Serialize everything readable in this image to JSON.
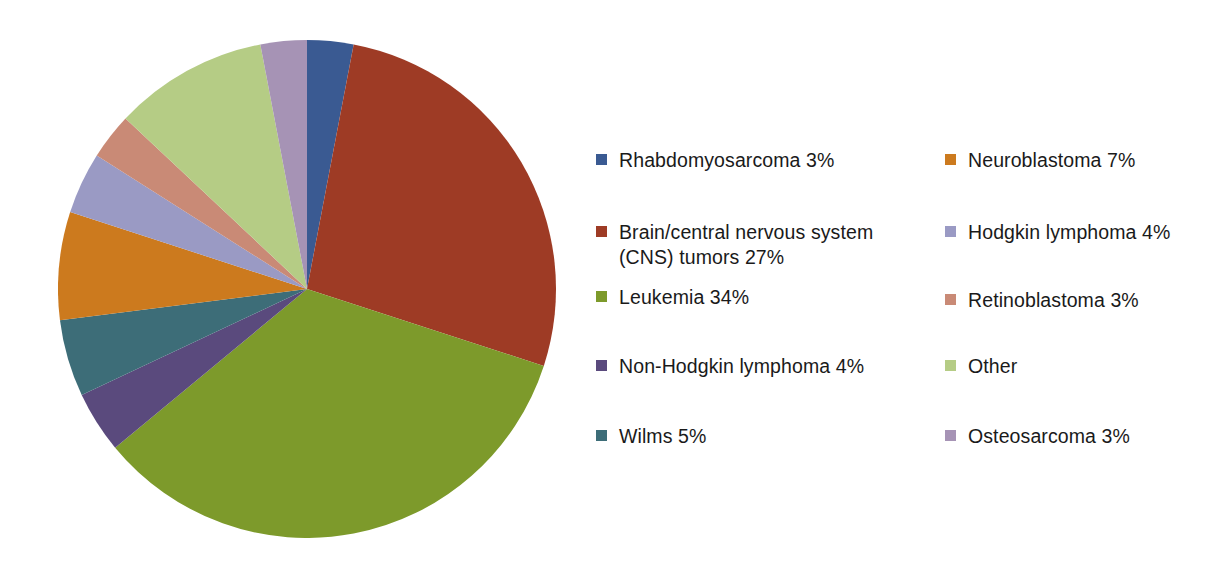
{
  "chart_data": {
    "type": "pie",
    "title": "",
    "subtitle": "",
    "xlabel": "",
    "ylabel": "",
    "grid": false,
    "legend_position": "right",
    "legend_columns": 2,
    "start_angle_deg": 0,
    "direction": "clockwise",
    "units": "percent",
    "total": 100,
    "categories": [
      "Rhabdomyosarcoma",
      "Brain/central nervous system (CNS) tumors",
      "Leukemia",
      "Non-Hodgkin lymphoma",
      "Wilms",
      "Neuroblastoma",
      "Hodgkin lymphoma",
      "Retinoblastoma",
      "Other",
      "Osteosarcoma"
    ],
    "values": [
      3,
      27,
      34,
      4,
      5,
      7,
      4,
      3,
      10,
      3
    ],
    "colors": [
      "#3a5a92",
      "#9e3b25",
      "#7d9a2b",
      "#5a4a7d",
      "#3d6d78",
      "#cc7a1e",
      "#9a9ac4",
      "#c98a76",
      "#b5cc85",
      "#a693b5"
    ],
    "slices": [
      {
        "label": "Rhabdomyosarcoma",
        "value": 3,
        "color": "#3a5a92"
      },
      {
        "label": "Brain/central nervous system (CNS) tumors",
        "value": 27,
        "color": "#9e3b25"
      },
      {
        "label": "Leukemia",
        "value": 34,
        "color": "#7d9a2b"
      },
      {
        "label": "Non-Hodgkin lymphoma",
        "value": 4,
        "color": "#5a4a7d"
      },
      {
        "label": "Wilms",
        "value": 5,
        "color": "#3d6d78"
      },
      {
        "label": "Neuroblastoma",
        "value": 7,
        "color": "#cc7a1e"
      },
      {
        "label": "Hodgkin lymphoma",
        "value": 4,
        "color": "#9a9ac4"
      },
      {
        "label": "Retinoblastoma",
        "value": 3,
        "color": "#c98a76"
      },
      {
        "label": "Other",
        "value": 10,
        "color": "#b5cc85"
      },
      {
        "label": "Osteosarcoma",
        "value": 3,
        "color": "#a693b5"
      }
    ]
  },
  "legend": {
    "left_column": [
      {
        "label": "Rhabdomyosarcoma 3%",
        "color": "#3a5a92",
        "top": 0
      },
      {
        "label": "Brain/central nervous system\n(CNS) tumors 27%",
        "color": "#9e3b25",
        "top": 72
      },
      {
        "label": "Leukemia 34%",
        "color": "#7d9a2b",
        "top": 137
      },
      {
        "label": "Non-Hodgkin lymphoma 4%",
        "color": "#5a4a7d",
        "top": 206
      },
      {
        "label": "Wilms 5%",
        "color": "#3d6d78",
        "top": 276
      }
    ],
    "right_column": [
      {
        "label": "Neuroblastoma 7%",
        "color": "#cc7a1e",
        "top": 0
      },
      {
        "label": "Hodgkin lymphoma 4%",
        "color": "#9a9ac4",
        "top": 72
      },
      {
        "label": "Retinoblastoma 3%",
        "color": "#c98a76",
        "top": 140
      },
      {
        "label": "Other",
        "color": "#b5cc85",
        "top": 206
      },
      {
        "label": "Osteosarcoma 3%",
        "color": "#a693b5",
        "top": 276
      }
    ]
  }
}
